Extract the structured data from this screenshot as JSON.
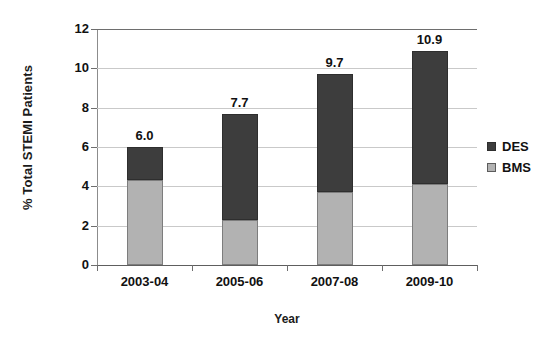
{
  "chart_data": {
    "type": "bar",
    "subtype": "stacked-bar",
    "title": "",
    "xlabel": "Year",
    "ylabel": "% Total STEMI Patients",
    "categories": [
      "2003-04",
      "2005-06",
      "2007-08",
      "2009-10"
    ],
    "series": [
      {
        "name": "BMS",
        "values": [
          4.3,
          2.3,
          3.7,
          4.1
        ],
        "color": "#b2b2b2",
        "stack_order": "bottom"
      },
      {
        "name": "DES",
        "values": [
          1.7,
          5.4,
          6.0,
          6.8
        ],
        "color": "#3d3d3d",
        "stack_order": "top"
      }
    ],
    "totals": [
      6.0,
      7.7,
      9.7,
      10.9
    ],
    "total_labels": [
      "6.0",
      "7.7",
      "9.7",
      "10.9"
    ],
    "ylim": [
      0,
      12
    ],
    "yticks": [
      0,
      2,
      4,
      6,
      8,
      10,
      12
    ],
    "ytick_labels": [
      "0",
      "2",
      "4",
      "6",
      "8",
      "10",
      "12"
    ],
    "grid": true,
    "grid_axis": "y",
    "legend_position": "right",
    "legend_entries": [
      "DES",
      "BMS"
    ],
    "background_color": "#ffffff",
    "grid_color": "#c9c9c9",
    "axis_color": "#6e6e6e"
  }
}
